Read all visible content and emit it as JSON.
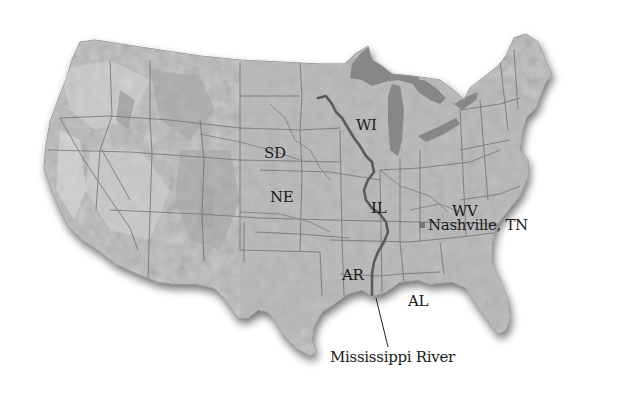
{
  "map": {
    "title": "United States relief map",
    "colors": {
      "land": "#b9b9b9",
      "land_light": "#cfcfcf",
      "relief_dark": "#9c9c9c",
      "water_lakes": "#878787",
      "borders": "#6e6e6e",
      "river": "#555555",
      "label_text": "#1a1a1a",
      "background": "#ffffff"
    },
    "labels": {
      "sd": "SD",
      "ne": "NE",
      "wi": "WI",
      "il": "IL",
      "wv": "WV",
      "ar": "AR",
      "al": "AL",
      "nashville": "Nashville, TN",
      "river": "Mississippi River"
    },
    "markers": [
      {
        "name": "Nashville, TN",
        "type": "city-point"
      }
    ]
  }
}
